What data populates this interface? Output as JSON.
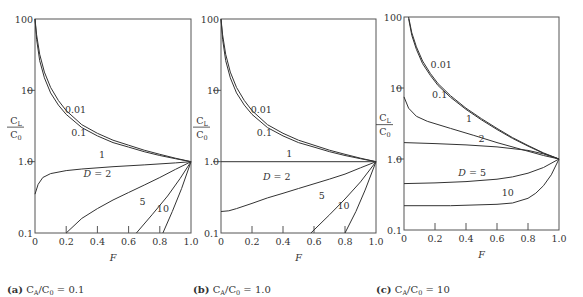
{
  "chart_data": [
    {
      "type": "line",
      "title": "(a) C_A/C_0 = 0.1",
      "caption_prefix": "(a)",
      "caption_text": "CA/C0 = 0.1",
      "xlabel": "F",
      "ylabel": "C_L/C_0",
      "yscale": "log",
      "xlim": [
        0,
        1.0
      ],
      "ylim": [
        0.1,
        100
      ],
      "xticks": [
        "0",
        "0.2",
        "0.4",
        "0.6",
        "0.8",
        "1.0"
      ],
      "yticks": [
        "0.1",
        "1.0",
        "10",
        "100"
      ],
      "series": [
        {
          "name": "0.01",
          "x": [
            0.0,
            0.01,
            0.03,
            0.06,
            0.1,
            0.15,
            0.2,
            0.3,
            0.4,
            0.5,
            0.6,
            0.7,
            0.8,
            0.9,
            1.0
          ],
          "y": [
            100,
            60,
            32,
            18,
            11,
            7.2,
            5.2,
            3.3,
            2.5,
            2.0,
            1.7,
            1.45,
            1.27,
            1.12,
            1.0
          ]
        },
        {
          "name": "0.1",
          "x": [
            0.0,
            0.01,
            0.03,
            0.06,
            0.1,
            0.15,
            0.2,
            0.3,
            0.4,
            0.5,
            0.6,
            0.7,
            0.8,
            0.9,
            1.0
          ],
          "y": [
            100,
            52,
            26,
            15,
            9.2,
            6.2,
            4.6,
            3.0,
            2.3,
            1.85,
            1.6,
            1.38,
            1.22,
            1.1,
            1.0
          ]
        },
        {
          "name": "1",
          "x": [
            0.0,
            0.02,
            0.05,
            0.1,
            0.2,
            0.3,
            0.5,
            0.7,
            0.9,
            1.0
          ],
          "y": [
            0.35,
            0.48,
            0.6,
            0.68,
            0.75,
            0.79,
            0.85,
            0.9,
            0.96,
            1.0
          ]
        },
        {
          "name": "D = 2",
          "x": [
            0.2,
            0.3,
            0.4,
            0.5,
            0.6,
            0.7,
            0.8,
            0.9,
            1.0
          ],
          "y": [
            0.1,
            0.16,
            0.22,
            0.29,
            0.37,
            0.47,
            0.6,
            0.78,
            1.0
          ]
        },
        {
          "name": "5",
          "x": [
            0.65,
            0.75,
            0.85,
            0.93,
            1.0
          ],
          "y": [
            0.1,
            0.18,
            0.33,
            0.58,
            1.0
          ]
        },
        {
          "name": "10",
          "x": [
            0.82,
            0.88,
            0.94,
            1.0
          ],
          "y": [
            0.1,
            0.2,
            0.42,
            1.0
          ]
        }
      ],
      "labels": [
        {
          "text": "0.01",
          "x": 0.26,
          "y": 4.8
        },
        {
          "text": "0.1",
          "x": 0.28,
          "y": 2.3
        },
        {
          "text": "1",
          "x": 0.43,
          "y": 1.12
        },
        {
          "text": "D = 2",
          "x": 0.4,
          "y": 0.6
        },
        {
          "text": "5",
          "x": 0.69,
          "y": 0.25
        },
        {
          "text": "10",
          "x": 0.82,
          "y": 0.2
        }
      ]
    },
    {
      "type": "line",
      "title": "(b) C_A/C_0 = 1.0",
      "caption_prefix": "(b)",
      "caption_text": "CA/C0 = 1.0",
      "xlabel": "F",
      "ylabel": "C_L/C_0",
      "yscale": "log",
      "xlim": [
        0,
        1.0
      ],
      "ylim": [
        0.1,
        100
      ],
      "xticks": [
        "0",
        "0.2",
        "0.4",
        "0.6",
        "0.8",
        "1.0"
      ],
      "yticks": [
        "0.1",
        "1.0",
        "10",
        "100"
      ],
      "series": [
        {
          "name": "0.01",
          "x": [
            0.0,
            0.01,
            0.03,
            0.06,
            0.1,
            0.15,
            0.2,
            0.3,
            0.4,
            0.5,
            0.6,
            0.7,
            0.8,
            0.9,
            1.0
          ],
          "y": [
            100,
            60,
            32,
            18,
            11,
            7.2,
            5.2,
            3.3,
            2.5,
            2.0,
            1.7,
            1.45,
            1.27,
            1.12,
            1.0
          ]
        },
        {
          "name": "0.1",
          "x": [
            0.0,
            0.01,
            0.03,
            0.06,
            0.1,
            0.15,
            0.2,
            0.3,
            0.4,
            0.5,
            0.6,
            0.7,
            0.8,
            0.9,
            1.0
          ],
          "y": [
            100,
            52,
            26,
            15,
            9.2,
            6.2,
            4.6,
            3.0,
            2.3,
            1.85,
            1.6,
            1.38,
            1.22,
            1.1,
            1.0
          ]
        },
        {
          "name": "1",
          "x": [
            0.0,
            1.0
          ],
          "y": [
            1.0,
            1.0
          ]
        },
        {
          "name": "D = 2",
          "x": [
            0.0,
            0.05,
            0.1,
            0.2,
            0.3,
            0.4,
            0.5,
            0.6,
            0.7,
            0.8,
            0.9,
            1.0
          ],
          "y": [
            0.2,
            0.205,
            0.22,
            0.26,
            0.31,
            0.36,
            0.42,
            0.49,
            0.57,
            0.67,
            0.82,
            1.0
          ]
        },
        {
          "name": "5",
          "x": [
            0.58,
            0.7,
            0.8,
            0.9,
            1.0
          ],
          "y": [
            0.1,
            0.18,
            0.3,
            0.52,
            1.0
          ]
        },
        {
          "name": "10",
          "x": [
            0.8,
            0.87,
            0.93,
            1.0
          ],
          "y": [
            0.1,
            0.2,
            0.4,
            1.0
          ]
        }
      ],
      "labels": [
        {
          "text": "0.01",
          "x": 0.26,
          "y": 4.8
        },
        {
          "text": "0.1",
          "x": 0.28,
          "y": 2.3
        },
        {
          "text": "1",
          "x": 0.44,
          "y": 1.15
        },
        {
          "text": "D = 2",
          "x": 0.36,
          "y": 0.55
        },
        {
          "text": "5",
          "x": 0.65,
          "y": 0.3
        },
        {
          "text": "10",
          "x": 0.79,
          "y": 0.22
        }
      ]
    },
    {
      "type": "line",
      "title": "(c) C_A/C_0 = 10",
      "caption_prefix": "(c)",
      "caption_text": "CA/C0 = 10",
      "xlabel": "F",
      "ylabel": "C_L/C_0",
      "yscale": "log",
      "xlim": [
        0,
        1.0
      ],
      "ylim": [
        0.1,
        100
      ],
      "xticks": [
        "0",
        "0.2",
        "0.4",
        "0.6",
        "0.8",
        "1.0"
      ],
      "yticks": [
        "0.1",
        "1.0",
        "10",
        "100"
      ],
      "series": [
        {
          "name": "0.01",
          "x": [
            0.03,
            0.05,
            0.08,
            0.12,
            0.17,
            0.22,
            0.3,
            0.4,
            0.5,
            0.6,
            0.7,
            0.8,
            0.9,
            1.0
          ],
          "y": [
            100,
            60,
            38,
            24,
            16,
            11.5,
            7.8,
            5.2,
            3.7,
            2.7,
            2.0,
            1.55,
            1.22,
            1.0
          ]
        },
        {
          "name": "0.1",
          "x": [
            0.03,
            0.05,
            0.08,
            0.12,
            0.17,
            0.22,
            0.3,
            0.4,
            0.5,
            0.6,
            0.7,
            0.8,
            0.9,
            1.0
          ],
          "y": [
            95,
            55,
            35,
            22,
            15,
            10.8,
            7.4,
            5.0,
            3.55,
            2.6,
            1.95,
            1.52,
            1.2,
            1.0
          ]
        },
        {
          "name": "1",
          "x": [
            0.0,
            0.03,
            0.08,
            0.15,
            0.3,
            0.45,
            0.6,
            0.75,
            0.9,
            1.0
          ],
          "y": [
            7.5,
            5.2,
            4.0,
            3.4,
            2.7,
            2.15,
            1.7,
            1.38,
            1.12,
            1.0
          ]
        },
        {
          "name": "2",
          "x": [
            0.0,
            0.2,
            0.4,
            0.6,
            0.8,
            0.9,
            1.0
          ],
          "y": [
            1.7,
            1.65,
            1.58,
            1.48,
            1.32,
            1.18,
            1.0
          ]
        },
        {
          "name": "D = 5",
          "x": [
            0.0,
            0.2,
            0.4,
            0.6,
            0.7,
            0.8,
            0.9,
            1.0
          ],
          "y": [
            0.45,
            0.46,
            0.48,
            0.52,
            0.56,
            0.63,
            0.76,
            1.0
          ]
        },
        {
          "name": "10",
          "x": [
            0.0,
            0.3,
            0.6,
            0.7,
            0.8,
            0.85,
            0.9,
            0.95,
            1.0
          ],
          "y": [
            0.22,
            0.22,
            0.23,
            0.24,
            0.28,
            0.33,
            0.42,
            0.6,
            1.0
          ]
        }
      ],
      "labels": [
        {
          "text": "0.01",
          "x": 0.24,
          "y": 19
        },
        {
          "text": "0.1",
          "x": 0.23,
          "y": 7.3
        },
        {
          "text": "1",
          "x": 0.42,
          "y": 3.3
        },
        {
          "text": "2",
          "x": 0.5,
          "y": 1.75
        },
        {
          "text": "D = 5",
          "x": 0.44,
          "y": 0.58
        },
        {
          "text": "10",
          "x": 0.67,
          "y": 0.3
        }
      ]
    }
  ],
  "panels": [
    {
      "left": 35,
      "right": 191,
      "top": 19,
      "bottom": 233
    },
    {
      "left": 221,
      "right": 376,
      "top": 19,
      "bottom": 233
    },
    {
      "left": 404,
      "right": 559,
      "top": 17,
      "bottom": 230
    }
  ]
}
